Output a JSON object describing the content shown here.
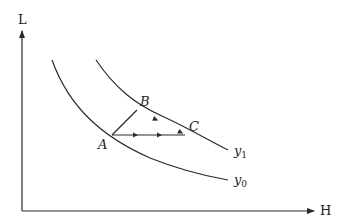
{
  "axes": {
    "y_label": "L",
    "x_label": "H"
  },
  "curves": [
    {
      "name": "y0",
      "label_base": "y",
      "label_sub": "0"
    },
    {
      "name": "y1",
      "label_base": "y",
      "label_sub": "1"
    }
  ],
  "points": {
    "A": "A",
    "B": "B",
    "C": "C"
  },
  "colors": {
    "line": "#2a2a2a",
    "background": "#ffffff"
  }
}
